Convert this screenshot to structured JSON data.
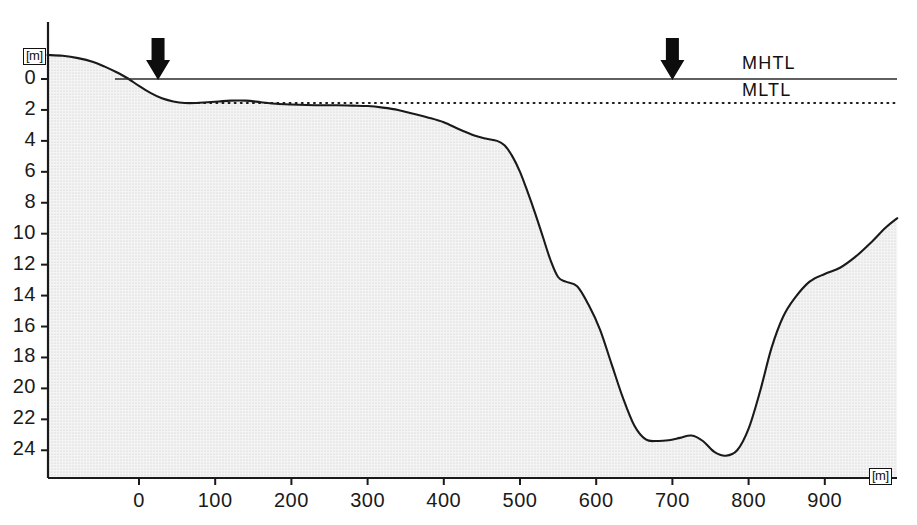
{
  "figure": {
    "background_color": "#ffffff",
    "line_color": "#1a1a1a",
    "fill_color": "#eeeeee",
    "unit_symbol": "[m]"
  },
  "axes": {
    "y_unit_label": "[m]",
    "x_unit_label": "[m]",
    "y_ticks": [
      0,
      2,
      4,
      6,
      8,
      10,
      12,
      14,
      16,
      18,
      20,
      22,
      24
    ],
    "y_tick_labels": [
      "0",
      "2",
      "4",
      "6",
      "8",
      "10",
      "12",
      "14",
      "16",
      "18",
      "20",
      "22",
      "24"
    ],
    "x_ticks": [
      0,
      100,
      200,
      300,
      400,
      500,
      600,
      700,
      800,
      900
    ],
    "x_tick_labels": [
      "0",
      "100",
      "200",
      "300",
      "400",
      "500",
      "600",
      "700",
      "800",
      "900"
    ]
  },
  "annotations": {
    "mhtl_label": "MHTL",
    "mltl_label": "MLTL",
    "arrow_markers": [
      {
        "name": "arrow-marker-left",
        "x": 25
      },
      {
        "name": "arrow-marker-right",
        "x": 700
      }
    ]
  },
  "chart_data": {
    "type": "area",
    "title": "",
    "subtitle": "",
    "xlabel": "[m]",
    "ylabel": "[m]",
    "xlim": [
      -120,
      995
    ],
    "ylim": [
      -2.0,
      25.8
    ],
    "y_axis_inverted": true,
    "grid": false,
    "legend_position": "inline-right",
    "annotations": [
      {
        "label": "MHTL",
        "type": "horizontal-line",
        "style": "solid",
        "y": 0.0,
        "x_start": -120,
        "x_end": 995
      },
      {
        "label": "MLTL",
        "type": "horizontal-line",
        "style": "dotted",
        "y": 1.55,
        "x_start": -120,
        "x_end": 995
      },
      {
        "label": "arrow",
        "type": "down-arrow",
        "x": 25,
        "y": -1.6
      },
      {
        "label": "arrow",
        "type": "down-arrow",
        "x": 700,
        "y": -1.6
      }
    ],
    "series": [
      {
        "name": "Seabed profile",
        "x": [
          -120,
          -100,
          -80,
          -60,
          -45,
          -30,
          -15,
          0,
          15,
          30,
          45,
          60,
          75,
          90,
          105,
          120,
          140,
          160,
          180,
          200,
          220,
          240,
          260,
          280,
          300,
          320,
          340,
          360,
          380,
          400,
          420,
          440,
          455,
          470,
          480,
          490,
          500,
          510,
          520,
          530,
          540,
          550,
          560,
          575,
          590,
          605,
          620,
          635,
          650,
          665,
          680,
          695,
          710,
          725,
          740,
          755,
          770,
          785,
          800,
          815,
          830,
          845,
          860,
          880,
          900,
          920,
          940,
          960,
          980,
          995
        ],
        "y": [
          -1.55,
          -1.5,
          -1.35,
          -1.1,
          -0.8,
          -0.45,
          -0.05,
          0.45,
          0.9,
          1.25,
          1.45,
          1.55,
          1.55,
          1.5,
          1.45,
          1.4,
          1.4,
          1.5,
          1.6,
          1.65,
          1.68,
          1.7,
          1.7,
          1.72,
          1.75,
          1.85,
          2.0,
          2.25,
          2.5,
          2.8,
          3.25,
          3.65,
          3.85,
          4.0,
          4.3,
          5.0,
          6.0,
          7.3,
          8.7,
          10.2,
          11.7,
          12.8,
          13.1,
          13.4,
          14.6,
          16.2,
          18.4,
          20.6,
          22.4,
          23.3,
          23.4,
          23.35,
          23.2,
          23.05,
          23.4,
          24.1,
          24.35,
          24.0,
          22.6,
          20.2,
          17.4,
          15.4,
          14.2,
          13.1,
          12.6,
          12.2,
          11.5,
          10.6,
          9.6,
          9.0
        ],
        "unit": "m depth"
      }
    ]
  }
}
